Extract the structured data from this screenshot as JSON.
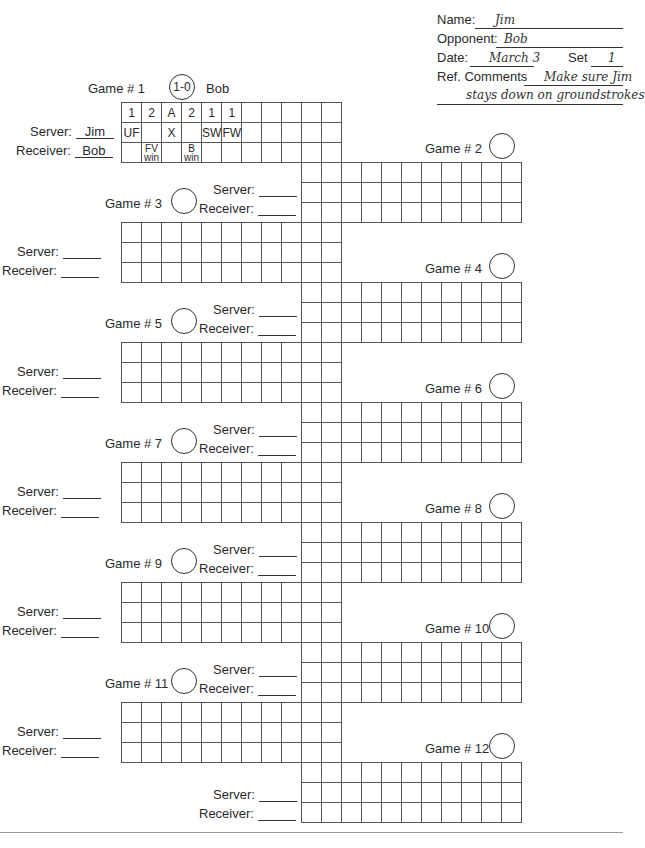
{
  "header": {
    "name_label": "Name:",
    "name_value": "Jim",
    "opponent_label": "Opponent:",
    "opponent_value": "Bob",
    "date_label": "Date:",
    "date_value": "March 3",
    "set_label": "Set",
    "set_value": "1",
    "comments_label": "Ref. Comments",
    "comments_line1": "Make sure Jim",
    "comments_line2": "stays down on groundstrokes"
  },
  "labels": {
    "server": "Server:",
    "receiver": "Receiver:"
  },
  "games": [
    {
      "number": "Game # 1",
      "score": "1-0",
      "winner": "Bob",
      "server": "Jim",
      "receiver": "Bob",
      "rows": [
        [
          "1",
          "2",
          "A",
          "2",
          "1",
          "1",
          "",
          "",
          "",
          "",
          ""
        ],
        [
          "UF",
          "",
          "X",
          "",
          "SW",
          "FW",
          "",
          "",
          "",
          "",
          ""
        ],
        [
          "",
          "FV win",
          "",
          "B win",
          "",
          "",
          "",
          "",
          "",
          "",
          ""
        ]
      ]
    },
    {
      "number": "Game # 2",
      "score": "",
      "server": "",
      "receiver": ""
    },
    {
      "number": "Game # 3",
      "score": "",
      "server": "",
      "receiver": ""
    },
    {
      "number": "Game # 4",
      "score": "",
      "server": "",
      "receiver": ""
    },
    {
      "number": "Game # 5",
      "score": "",
      "server": "",
      "receiver": ""
    },
    {
      "number": "Game # 6",
      "score": "",
      "server": "",
      "receiver": ""
    },
    {
      "number": "Game # 7",
      "score": "",
      "server": "",
      "receiver": ""
    },
    {
      "number": "Game # 8",
      "score": "",
      "server": "",
      "receiver": ""
    },
    {
      "number": "Game # 9",
      "score": "",
      "server": "",
      "receiver": ""
    },
    {
      "number": "Game # 10",
      "score": "",
      "server": "",
      "receiver": ""
    },
    {
      "number": "Game # 11",
      "score": "",
      "server": "",
      "receiver": ""
    },
    {
      "number": "Game # 12",
      "score": "",
      "server": "",
      "receiver": ""
    }
  ]
}
